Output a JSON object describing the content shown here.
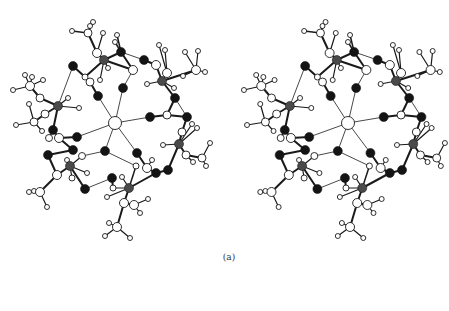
{
  "figure": {
    "caption": "(a)",
    "views": [
      {
        "name": "left-view",
        "offset_x": 0,
        "offset_y": 0
      },
      {
        "name": "right-view",
        "offset_x": 233,
        "offset_y": 0
      }
    ]
  },
  "colors": {
    "background": "#ffffff",
    "bond": "#1a1a1a",
    "atom_white": "#ffffff",
    "atom_black": "#141414",
    "atom_gray": "#4a4a4a",
    "outline": "#1a1a1a"
  },
  "atoms": [
    {
      "id": "c0",
      "x": 115,
      "y": 123,
      "r": 6.5,
      "type": "white"
    },
    {
      "id": "o1",
      "x": 123,
      "y": 88,
      "r": 4.5,
      "type": "black"
    },
    {
      "id": "o2",
      "x": 98,
      "y": 96,
      "r": 4.5,
      "type": "black"
    },
    {
      "id": "o3",
      "x": 150,
      "y": 117,
      "r": 4.5,
      "type": "black"
    },
    {
      "id": "o4",
      "x": 77,
      "y": 137,
      "r": 4.5,
      "type": "black"
    },
    {
      "id": "o5",
      "x": 105,
      "y": 151,
      "r": 4.5,
      "type": "black"
    },
    {
      "id": "o6",
      "x": 137,
      "y": 153,
      "r": 4.5,
      "type": "black"
    },
    {
      "id": "o7",
      "x": 73,
      "y": 66,
      "r": 4.5,
      "type": "black"
    },
    {
      "id": "o8",
      "x": 121,
      "y": 52,
      "r": 4.5,
      "type": "black"
    },
    {
      "id": "o9",
      "x": 144,
      "y": 60,
      "r": 4.5,
      "type": "black"
    },
    {
      "id": "o10",
      "x": 175,
      "y": 98,
      "r": 4.5,
      "type": "black"
    },
    {
      "id": "o11",
      "x": 187,
      "y": 117,
      "r": 4.5,
      "type": "black"
    },
    {
      "id": "o12",
      "x": 168,
      "y": 170,
      "r": 4.5,
      "type": "black"
    },
    {
      "id": "o13",
      "x": 156,
      "y": 173,
      "r": 4.5,
      "type": "black"
    },
    {
      "id": "o14",
      "x": 112,
      "y": 178,
      "r": 4.5,
      "type": "black"
    },
    {
      "id": "o15",
      "x": 85,
      "y": 189,
      "r": 4.5,
      "type": "black"
    },
    {
      "id": "o16",
      "x": 53,
      "y": 130,
      "r": 4.5,
      "type": "black"
    },
    {
      "id": "o17",
      "x": 48,
      "y": 155,
      "r": 4.5,
      "type": "black"
    },
    {
      "id": "o18",
      "x": 73,
      "y": 150,
      "r": 4.5,
      "type": "black"
    },
    {
      "id": "m1",
      "x": 104,
      "y": 60,
      "r": 4.5,
      "type": "gray"
    },
    {
      "id": "m2",
      "x": 58,
      "y": 106,
      "r": 4.5,
      "type": "gray"
    },
    {
      "id": "m3",
      "x": 162,
      "y": 81,
      "r": 4.5,
      "type": "gray"
    },
    {
      "id": "m4",
      "x": 179,
      "y": 144,
      "r": 4.5,
      "type": "gray"
    },
    {
      "id": "m5",
      "x": 70,
      "y": 166,
      "r": 4.5,
      "type": "gray"
    },
    {
      "id": "m6",
      "x": 129,
      "y": 188,
      "r": 4.5,
      "type": "gray"
    },
    {
      "id": "w1",
      "x": 90,
      "y": 82,
      "r": 4,
      "type": "white"
    },
    {
      "id": "w2",
      "x": 133,
      "y": 70,
      "r": 4.5,
      "type": "white"
    },
    {
      "id": "w3",
      "x": 97,
      "y": 53,
      "r": 4.5,
      "type": "white"
    },
    {
      "id": "w4",
      "x": 167,
      "y": 115,
      "r": 4,
      "type": "white"
    },
    {
      "id": "w5",
      "x": 147,
      "y": 168,
      "r": 4.5,
      "type": "white"
    },
    {
      "id": "w6",
      "x": 59,
      "y": 138,
      "r": 4.5,
      "type": "white"
    },
    {
      "id": "w7",
      "x": 49,
      "y": 138,
      "r": 3.5,
      "type": "white"
    },
    {
      "id": "w8",
      "x": 57,
      "y": 175,
      "r": 4.5,
      "type": "white"
    },
    {
      "id": "w9",
      "x": 40,
      "y": 192,
      "r": 4.5,
      "type": "white"
    },
    {
      "id": "w10",
      "x": 124,
      "y": 203,
      "r": 4.5,
      "type": "white"
    },
    {
      "id": "w11",
      "x": 134,
      "y": 205,
      "r": 4.5,
      "type": "white"
    },
    {
      "id": "w12",
      "x": 117,
      "y": 227,
      "r": 4.5,
      "type": "white"
    },
    {
      "id": "w13",
      "x": 156,
      "y": 65,
      "r": 4.5,
      "type": "white"
    },
    {
      "id": "w14",
      "x": 167,
      "y": 73,
      "r": 4.5,
      "type": "white"
    },
    {
      "id": "w15",
      "x": 196,
      "y": 70,
      "r": 4.5,
      "type": "white"
    },
    {
      "id": "w16",
      "x": 182,
      "y": 132,
      "r": 4,
      "type": "white"
    },
    {
      "id": "w17",
      "x": 186,
      "y": 155,
      "r": 4,
      "type": "white"
    },
    {
      "id": "w18",
      "x": 202,
      "y": 158,
      "r": 4,
      "type": "white"
    },
    {
      "id": "w19",
      "x": 88,
      "y": 33,
      "r": 4,
      "type": "white"
    },
    {
      "id": "w20",
      "x": 30,
      "y": 86,
      "r": 4.5,
      "type": "white"
    },
    {
      "id": "w21",
      "x": 40,
      "y": 98,
      "r": 4,
      "type": "white"
    },
    {
      "id": "w22",
      "x": 34,
      "y": 122,
      "r": 4,
      "type": "white"
    },
    {
      "id": "w23",
      "x": 45,
      "y": 114,
      "r": 4,
      "type": "white"
    },
    {
      "id": "w24",
      "x": 85,
      "y": 77,
      "r": 3,
      "type": "white"
    },
    {
      "id": "w25",
      "x": 136,
      "y": 166,
      "r": 3,
      "type": "white"
    },
    {
      "id": "w26",
      "x": 113,
      "y": 188,
      "r": 3,
      "type": "white"
    },
    {
      "id": "w27",
      "x": 82,
      "y": 156,
      "r": 3.5,
      "type": "white"
    },
    {
      "id": "w28",
      "x": 72,
      "y": 178,
      "r": 3,
      "type": "white"
    },
    {
      "id": "h1",
      "x": 72,
      "y": 31,
      "r": 2.5,
      "type": "white"
    },
    {
      "id": "h2",
      "x": 93,
      "y": 22,
      "r": 2.5,
      "type": "white"
    },
    {
      "id": "h3",
      "x": 90,
      "y": 26,
      "r": 2.5,
      "type": "white"
    },
    {
      "id": "h4",
      "x": 103,
      "y": 33,
      "r": 2.5,
      "type": "white"
    },
    {
      "id": "h5",
      "x": 117,
      "y": 35,
      "r": 2.5,
      "type": "white"
    },
    {
      "id": "h6",
      "x": 115,
      "y": 42,
      "r": 2.5,
      "type": "white"
    },
    {
      "id": "h7",
      "x": 100,
      "y": 80,
      "r": 2.5,
      "type": "white"
    },
    {
      "id": "h8",
      "x": 108,
      "y": 68,
      "r": 2.5,
      "type": "white"
    },
    {
      "id": "h9",
      "x": 25,
      "y": 75,
      "r": 2.5,
      "type": "white"
    },
    {
      "id": "h10",
      "x": 32,
      "y": 77,
      "r": 2.5,
      "type": "white"
    },
    {
      "id": "h11",
      "x": 13,
      "y": 90,
      "r": 2.5,
      "type": "white"
    },
    {
      "id": "h12",
      "x": 43,
      "y": 80,
      "r": 2.5,
      "type": "white"
    },
    {
      "id": "h13",
      "x": 29,
      "y": 104,
      "r": 2.5,
      "type": "white"
    },
    {
      "id": "h14",
      "x": 16,
      "y": 125,
      "r": 2.5,
      "type": "white"
    },
    {
      "id": "h15",
      "x": 42,
      "y": 131,
      "r": 2.5,
      "type": "white"
    },
    {
      "id": "h16",
      "x": 79,
      "y": 108,
      "r": 2.5,
      "type": "white"
    },
    {
      "id": "h17",
      "x": 68,
      "y": 98,
      "r": 2.5,
      "type": "white"
    },
    {
      "id": "h18",
      "x": 159,
      "y": 45,
      "r": 2.5,
      "type": "white"
    },
    {
      "id": "h19",
      "x": 165,
      "y": 50,
      "r": 2.5,
      "type": "white"
    },
    {
      "id": "h20",
      "x": 185,
      "y": 52,
      "r": 2.5,
      "type": "white"
    },
    {
      "id": "h21",
      "x": 198,
      "y": 51,
      "r": 2.5,
      "type": "white"
    },
    {
      "id": "h22",
      "x": 205,
      "y": 72,
      "r": 2.5,
      "type": "white"
    },
    {
      "id": "h23",
      "x": 183,
      "y": 76,
      "r": 2.5,
      "type": "white"
    },
    {
      "id": "h24",
      "x": 147,
      "y": 84,
      "r": 2.5,
      "type": "white"
    },
    {
      "id": "h25",
      "x": 174,
      "y": 88,
      "r": 2.5,
      "type": "white"
    },
    {
      "id": "h26",
      "x": 192,
      "y": 124,
      "r": 2.5,
      "type": "white"
    },
    {
      "id": "h27",
      "x": 197,
      "y": 128,
      "r": 2.5,
      "type": "white"
    },
    {
      "id": "h28",
      "x": 163,
      "y": 145,
      "r": 2.5,
      "type": "white"
    },
    {
      "id": "h29",
      "x": 210,
      "y": 143,
      "r": 2.5,
      "type": "white"
    },
    {
      "id": "h30",
      "x": 193,
      "y": 162,
      "r": 2.5,
      "type": "white"
    },
    {
      "id": "h31",
      "x": 206,
      "y": 166,
      "r": 2.5,
      "type": "white"
    },
    {
      "id": "h32",
      "x": 29,
      "y": 192,
      "r": 2.5,
      "type": "white"
    },
    {
      "id": "h33",
      "x": 34,
      "y": 191,
      "r": 2.5,
      "type": "white"
    },
    {
      "id": "h34",
      "x": 47,
      "y": 207,
      "r": 2.5,
      "type": "white"
    },
    {
      "id": "h35",
      "x": 67,
      "y": 160,
      "r": 2.5,
      "type": "white"
    },
    {
      "id": "h36",
      "x": 87,
      "y": 173,
      "r": 2.5,
      "type": "white"
    },
    {
      "id": "h37",
      "x": 107,
      "y": 197,
      "r": 2.5,
      "type": "white"
    },
    {
      "id": "h38",
      "x": 148,
      "y": 199,
      "r": 2.5,
      "type": "white"
    },
    {
      "id": "h39",
      "x": 140,
      "y": 213,
      "r": 2.5,
      "type": "white"
    },
    {
      "id": "h40",
      "x": 109,
      "y": 223,
      "r": 2.5,
      "type": "white"
    },
    {
      "id": "h41",
      "x": 105,
      "y": 236,
      "r": 2.5,
      "type": "white"
    },
    {
      "id": "h42",
      "x": 130,
      "y": 238,
      "r": 2.5,
      "type": "white"
    },
    {
      "id": "h43",
      "x": 152,
      "y": 160,
      "r": 2.5,
      "type": "white"
    },
    {
      "id": "h44",
      "x": 122,
      "y": 177,
      "r": 2.5,
      "type": "white"
    }
  ],
  "bonds": [
    [
      "c0",
      "o1",
      0.8
    ],
    [
      "c0",
      "o2",
      0.8
    ],
    [
      "c0",
      "o3",
      0.8
    ],
    [
      "c0",
      "o4",
      0.8
    ],
    [
      "c0",
      "o5",
      0.8
    ],
    [
      "c0",
      "o6",
      0.8
    ],
    [
      "o2",
      "w1",
      2
    ],
    [
      "w1",
      "o7",
      0.8
    ],
    [
      "o7",
      "w24",
      2
    ],
    [
      "w24",
      "m1",
      2
    ],
    [
      "m1",
      "w3",
      2
    ],
    [
      "w3",
      "w19",
      2
    ],
    [
      "w19",
      "h1",
      1.5
    ],
    [
      "w19",
      "h2",
      1.5
    ],
    [
      "w19",
      "h3",
      1.5
    ],
    [
      "m1",
      "o8",
      2
    ],
    [
      "m1",
      "w2",
      2
    ],
    [
      "o8",
      "w2",
      2
    ],
    [
      "w2",
      "o1",
      0.8
    ],
    [
      "o8",
      "h5",
      1.5
    ],
    [
      "o8",
      "h6",
      1.5
    ],
    [
      "h4",
      "w3",
      1.2
    ],
    [
      "m1",
      "h7",
      1.2
    ],
    [
      "m1",
      "h8",
      1.2
    ],
    [
      "o8",
      "o9",
      0.8
    ],
    [
      "o9",
      "w13",
      2
    ],
    [
      "w13",
      "m3",
      2
    ],
    [
      "m3",
      "w14",
      2
    ],
    [
      "w14",
      "h18",
      1.2
    ],
    [
      "w14",
      "h19",
      1.2
    ],
    [
      "m3",
      "w15",
      2.2
    ],
    [
      "w15",
      "h20",
      1.2
    ],
    [
      "w15",
      "h21",
      1.2
    ],
    [
      "w15",
      "h22",
      1.2
    ],
    [
      "w15",
      "h23",
      1.2
    ],
    [
      "m3",
      "h24",
      1.2
    ],
    [
      "m3",
      "h25",
      1.2
    ],
    [
      "m3",
      "o10",
      2
    ],
    [
      "o10",
      "w4",
      2
    ],
    [
      "w4",
      "o3",
      2
    ],
    [
      "o10",
      "o11",
      0.8
    ],
    [
      "w4",
      "o11",
      2
    ],
    [
      "o11",
      "w16",
      2
    ],
    [
      "w16",
      "m4",
      2
    ],
    [
      "m4",
      "h26",
      1.2
    ],
    [
      "m4",
      "h27",
      1.2
    ],
    [
      "m4",
      "w17",
      2
    ],
    [
      "w17",
      "w18",
      2
    ],
    [
      "w18",
      "h29",
      1.2
    ],
    [
      "w18",
      "h31",
      1.2
    ],
    [
      "w17",
      "h30",
      1.2
    ],
    [
      "m4",
      "h28",
      1.2
    ],
    [
      "m4",
      "o12",
      2
    ],
    [
      "o12",
      "o13",
      2
    ],
    [
      "o13",
      "w5",
      2
    ],
    [
      "w5",
      "o6",
      2
    ],
    [
      "w5",
      "h43",
      1.2
    ],
    [
      "o13",
      "m6",
      2
    ],
    [
      "m6",
      "w10",
      2
    ],
    [
      "w10",
      "w11",
      2
    ],
    [
      "w11",
      "h38",
      1.2
    ],
    [
      "w11",
      "h39",
      1.2
    ],
    [
      "w10",
      "w12",
      2
    ],
    [
      "w12",
      "h40",
      1.2
    ],
    [
      "w12",
      "h41",
      1.2
    ],
    [
      "w12",
      "h42",
      1.2
    ],
    [
      "m6",
      "h37",
      1.2
    ],
    [
      "m6",
      "w26",
      1.2
    ],
    [
      "m6",
      "h44",
      1.2
    ],
    [
      "w25",
      "m6",
      1.5
    ],
    [
      "o5",
      "w25",
      0.8
    ],
    [
      "o14",
      "w26",
      2
    ],
    [
      "o14",
      "o15",
      0.8
    ],
    [
      "o15",
      "m5",
      2
    ],
    [
      "m5",
      "w8",
      2
    ],
    [
      "w8",
      "w9",
      2
    ],
    [
      "w9",
      "h32",
      1.2
    ],
    [
      "w9",
      "h33",
      1.2
    ],
    [
      "w9",
      "h34",
      1.2
    ],
    [
      "m5",
      "h35",
      1.2
    ],
    [
      "m5",
      "h36",
      1.2
    ],
    [
      "m5",
      "w28",
      1.2
    ],
    [
      "m5",
      "w27",
      1.2
    ],
    [
      "w27",
      "o5",
      0.8
    ],
    [
      "o4",
      "w6",
      2
    ],
    [
      "w6",
      "o16",
      2
    ],
    [
      "o16",
      "m2",
      2
    ],
    [
      "w6",
      "o18",
      2
    ],
    [
      "o18",
      "o17",
      2
    ],
    [
      "o17",
      "w8",
      2
    ],
    [
      "m2",
      "w21",
      2
    ],
    [
      "w21",
      "w20",
      2
    ],
    [
      "w20",
      "h9",
      1.2
    ],
    [
      "w20",
      "h10",
      1.2
    ],
    [
      "w20",
      "h11",
      1.2
    ],
    [
      "w20",
      "h12",
      1.2
    ],
    [
      "m2",
      "w23",
      2
    ],
    [
      "w23",
      "w22",
      2
    ],
    [
      "w22",
      "h13",
      1.2
    ],
    [
      "w22",
      "h14",
      1.2
    ],
    [
      "w22",
      "h15",
      1.2
    ],
    [
      "m2",
      "h16",
      1.2
    ],
    [
      "m2",
      "h17",
      1.2
    ],
    [
      "m2",
      "o7",
      0.8
    ],
    [
      "w7",
      "o16",
      1.2
    ]
  ]
}
